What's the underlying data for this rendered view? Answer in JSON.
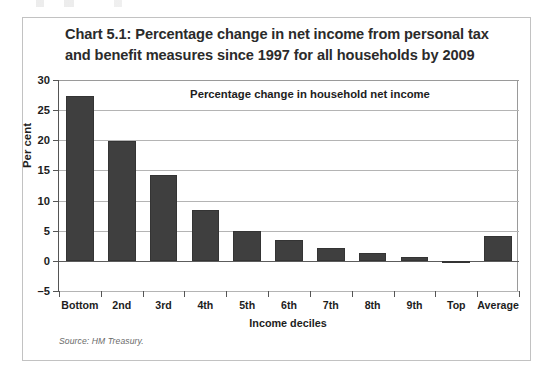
{
  "figure": {
    "title": "Chart 5.1: Percentage change in net income from personal tax and benefit measures since 1997 for all households by 2009",
    "source_note": "Source: HM Treasury.",
    "bar_color": "#3f3f3f",
    "grid_color": "#b4b4b4",
    "axis_color": "#555555",
    "frame_color": "#c2c2c2"
  },
  "chart_data": {
    "type": "bar",
    "title": "Chart 5.1: Percentage change in net income from personal tax and benefit measures since 1997 for all households by 2009",
    "subtitle": "Percentage change in household net income",
    "xlabel": "Income deciles",
    "ylabel": "Per cent",
    "categories": [
      "Bottom",
      "2nd",
      "3rd",
      "4th",
      "5th",
      "6th",
      "7th",
      "8th",
      "9th",
      "Top",
      "Average"
    ],
    "values": [
      27.3,
      19.8,
      14.2,
      8.4,
      4.9,
      3.5,
      2.1,
      1.3,
      0.6,
      -0.3,
      4.2
    ],
    "ylim": [
      -5,
      30
    ],
    "yticks": [
      30,
      25,
      20,
      15,
      10,
      5,
      0,
      -5
    ],
    "ytick_labels": [
      "30",
      "25",
      "20",
      "15",
      "10",
      "5",
      "0",
      "–5"
    ],
    "grid": true,
    "grid_axis": "y",
    "legend": "none",
    "series": [
      {
        "name": "Percentage change in household net income",
        "values": [
          27.3,
          19.8,
          14.2,
          8.4,
          4.9,
          3.5,
          2.1,
          1.3,
          0.6,
          -0.3,
          4.2
        ]
      }
    ]
  }
}
